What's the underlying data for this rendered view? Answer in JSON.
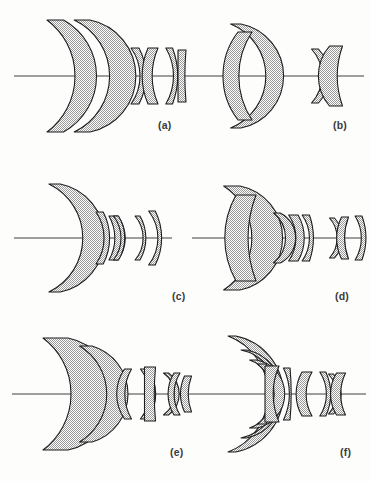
{
  "figure": {
    "kind": "optical-lens-cross-section-diagram",
    "background_color": "#fdfdfc",
    "outline_color": "#1d1d1d",
    "glass_fill_color": "#b4b4b4",
    "axis_color": "#2a2a2a",
    "label_color": "#3a3a3a",
    "panel_count": 6
  },
  "panels": [
    {
      "id": "a",
      "label": "(a)",
      "label_x": 158,
      "label_y": 119,
      "axis": {
        "x1": 14,
        "x2": 196,
        "y": 76
      },
      "element_count": 6,
      "groups": [
        {
          "name": "front-group",
          "element_count": 2
        },
        {
          "name": "rear-group",
          "element_count": 3
        }
      ],
      "elements": [
        {
          "index": 1,
          "type": "meniscus",
          "cx": 40,
          "cy": 76,
          "half_height": 56,
          "thickness": 14,
          "front_r": 70,
          "back_r": 64,
          "shift": 0
        },
        {
          "index": 2,
          "type": "meniscus",
          "cx": 65,
          "cy": 76,
          "half_height": 56,
          "thickness": 17,
          "front_r": 62,
          "back_r": 44,
          "shift": 0
        },
        {
          "index": 3,
          "type": "meniscus",
          "cx": 131,
          "cy": 76,
          "half_height": 28,
          "thickness": 9,
          "front_r": 48,
          "back_r": 60,
          "shift": 0
        },
        {
          "index": 4,
          "type": "biconvex",
          "cx": 153,
          "cy": 76,
          "half_height": 28,
          "thickness": 10,
          "front_r": 70,
          "back_r": 70,
          "shift": 0
        },
        {
          "index": 5,
          "type": "meniscus",
          "cx": 166,
          "cy": 76,
          "half_height": 28,
          "thickness": 8,
          "front_r": 55,
          "back_r": 80,
          "shift": 0
        },
        {
          "index": 6,
          "type": "plano-convex",
          "cx": 182,
          "cy": 76,
          "half_height": 26,
          "thickness": 8,
          "front_r": 90,
          "back_r": 300,
          "shift": 0
        }
      ]
    },
    {
      "id": "b",
      "label": "(b)",
      "label_x": 333,
      "label_y": 119,
      "axis": {
        "x1": 196,
        "x2": 364,
        "y": 76
      },
      "element_count": 4,
      "groups": [
        {
          "name": "front-group",
          "element_count": 2
        },
        {
          "name": "rear-group",
          "element_count": 2
        }
      ],
      "elements": [
        {
          "index": 1,
          "type": "meniscus",
          "cx": 218,
          "cy": 76,
          "half_height": 52,
          "thickness": 10,
          "front_r": 56,
          "back_r": 48,
          "shift": 0
        },
        {
          "index": 2,
          "type": "biconvex",
          "cx": 245,
          "cy": 76,
          "half_height": 44,
          "thickness": 14,
          "front_r": 72,
          "back_r": 80,
          "shift": 0
        },
        {
          "index": 3,
          "type": "biconcave",
          "cx": 315,
          "cy": 76,
          "half_height": 27,
          "thickness": 7,
          "front_r": 40,
          "back_r": 40,
          "shift": 0
        },
        {
          "index": 4,
          "type": "biconvex",
          "cx": 336,
          "cy": 76,
          "half_height": 30,
          "thickness": 13,
          "front_r": 46,
          "back_r": 90,
          "shift": 0
        }
      ]
    },
    {
      "id": "c",
      "label": "(c)",
      "label_x": 172,
      "label_y": 290,
      "axis": {
        "x1": 14,
        "x2": 172,
        "y": 238
      },
      "element_count": 6,
      "groups": [
        {
          "name": "front-group",
          "element_count": 1
        },
        {
          "name": "rear-group",
          "element_count": 5
        }
      ],
      "elements": [
        {
          "index": 1,
          "type": "meniscus",
          "cx": 36,
          "cy": 238,
          "half_height": 54,
          "thickness": 8,
          "front_r": 60,
          "back_r": 54,
          "shift": 0
        },
        {
          "index": 2,
          "type": "meniscus",
          "cx": 96,
          "cy": 238,
          "half_height": 26,
          "thickness": 8,
          "front_r": 46,
          "back_r": 56,
          "shift": 0
        },
        {
          "index": 3,
          "type": "meniscus",
          "cx": 110,
          "cy": 238,
          "half_height": 22,
          "thickness": 8,
          "front_r": 44,
          "back_r": 36,
          "shift": 0
        },
        {
          "index": 4,
          "type": "biconcave",
          "cx": 116,
          "cy": 238,
          "half_height": 22,
          "thickness": 5,
          "front_r": 36,
          "back_r": 42,
          "shift": 0
        },
        {
          "index": 5,
          "type": "meniscus",
          "cx": 134,
          "cy": 238,
          "half_height": 22,
          "thickness": 6,
          "front_r": 34,
          "back_r": 44,
          "shift": 0
        },
        {
          "index": 6,
          "type": "meniscus",
          "cx": 148,
          "cy": 238,
          "half_height": 27,
          "thickness": 8,
          "front_r": 44,
          "back_r": 60,
          "shift": 0
        }
      ]
    },
    {
      "id": "d",
      "label": "(d)",
      "label_x": 335,
      "label_y": 290,
      "axis": {
        "x1": 192,
        "x2": 366,
        "y": 238
      },
      "element_count": 8,
      "groups": [
        {
          "name": "front-group",
          "element_count": 4
        },
        {
          "name": "rear-group",
          "element_count": 4
        }
      ],
      "elements": [
        {
          "index": 1,
          "type": "meniscus",
          "cx": 215,
          "cy": 238,
          "half_height": 52,
          "thickness": 11,
          "front_r": 62,
          "back_r": 52,
          "shift": 0
        },
        {
          "index": 2,
          "type": "biconvex",
          "cx": 246,
          "cy": 238,
          "half_height": 43,
          "thickness": 20,
          "front_r": 88,
          "back_r": 120,
          "shift": 0
        },
        {
          "index": 3,
          "type": "meniscus",
          "cx": 270,
          "cy": 238,
          "half_height": 25,
          "thickness": 5,
          "front_r": 32,
          "back_r": 28,
          "shift": 0
        },
        {
          "index": 4,
          "type": "meniscus",
          "cx": 290,
          "cy": 238,
          "half_height": 23,
          "thickness": 10,
          "front_r": 40,
          "back_r": 46,
          "shift": 0
        },
        {
          "index": 5,
          "type": "meniscus",
          "cx": 303,
          "cy": 238,
          "half_height": 23,
          "thickness": 9,
          "front_r": 40,
          "back_r": 70,
          "shift": 0
        },
        {
          "index": 6,
          "type": "biconcave",
          "cx": 332,
          "cy": 238,
          "half_height": 20,
          "thickness": 5,
          "front_r": 30,
          "back_r": 30,
          "shift": 0
        },
        {
          "index": 7,
          "type": "biconvex",
          "cx": 345,
          "cy": 238,
          "half_height": 21,
          "thickness": 7,
          "front_r": 48,
          "back_r": 60,
          "shift": 0
        },
        {
          "index": 8,
          "type": "meniscus",
          "cx": 356,
          "cy": 238,
          "half_height": 22,
          "thickness": 8,
          "front_r": 42,
          "back_r": 64,
          "shift": 0
        }
      ]
    },
    {
      "id": "e",
      "label": "(e)",
      "label_x": 170,
      "label_y": 446,
      "axis": {
        "x1": 12,
        "x2": 192,
        "y": 394
      },
      "element_count": 8,
      "groups": [
        {
          "name": "front-group",
          "element_count": 2
        },
        {
          "name": "rear-group",
          "element_count": 6
        }
      ],
      "elements": [
        {
          "index": 1,
          "type": "meniscus",
          "cx": 38,
          "cy": 394,
          "half_height": 56,
          "thickness": 18,
          "front_r": 70,
          "back_r": 56,
          "shift": 0
        },
        {
          "index": 2,
          "type": "meniscus",
          "cx": 70,
          "cy": 394,
          "half_height": 48,
          "thickness": 8,
          "front_r": 56,
          "back_r": 50,
          "shift": 0
        },
        {
          "index": 3,
          "type": "biconvex",
          "cx": 128,
          "cy": 394,
          "half_height": 25,
          "thickness": 7,
          "front_r": 44,
          "back_r": 50,
          "shift": 0
        },
        {
          "index": 4,
          "type": "meniscus",
          "cx": 140,
          "cy": 394,
          "half_height": 25,
          "thickness": 8,
          "front_r": 40,
          "back_r": 44,
          "shift": 0
        },
        {
          "index": 5,
          "type": "plano-convex",
          "cx": 150,
          "cy": 394,
          "half_height": 27,
          "thickness": 11,
          "front_r": 44,
          "back_r": 300,
          "shift": 0
        },
        {
          "index": 6,
          "type": "biconcave",
          "cx": 166,
          "cy": 394,
          "half_height": 21,
          "thickness": 5,
          "front_r": 26,
          "back_r": 26,
          "shift": 0
        },
        {
          "index": 7,
          "type": "biconvex",
          "cx": 177,
          "cy": 394,
          "half_height": 21,
          "thickness": 6,
          "front_r": 40,
          "back_r": 40,
          "shift": 0
        },
        {
          "index": 8,
          "type": "biconvex",
          "cx": 188,
          "cy": 394,
          "half_height": 18,
          "thickness": 7,
          "front_r": 44,
          "back_r": 52,
          "shift": 0
        }
      ]
    },
    {
      "id": "f",
      "label": "(f)",
      "label_x": 340,
      "label_y": 446,
      "axis": {
        "x1": 192,
        "x2": 366,
        "y": 394
      },
      "element_count": 10,
      "groups": [
        {
          "name": "front-group",
          "element_count": 4
        },
        {
          "name": "middle-group",
          "element_count": 2
        },
        {
          "name": "rear-group",
          "element_count": 4
        }
      ],
      "elements": [
        {
          "index": 1,
          "type": "meniscus",
          "cx": 211,
          "cy": 394,
          "half_height": 58,
          "thickness": 6,
          "front_r": 62,
          "back_r": 58,
          "shift": 0
        },
        {
          "index": 2,
          "type": "meniscus",
          "cx": 228,
          "cy": 394,
          "half_height": 44,
          "thickness": 7,
          "front_r": 44,
          "back_r": 40,
          "shift": 0
        },
        {
          "index": 3,
          "type": "meniscus",
          "cx": 241,
          "cy": 394,
          "half_height": 34,
          "thickness": 7,
          "front_r": 36,
          "back_r": 33,
          "shift": 0
        },
        {
          "index": 4,
          "type": "meniscus",
          "cx": 256,
          "cy": 394,
          "half_height": 30,
          "thickness": 12,
          "front_r": 38,
          "back_r": 60,
          "shift": 0
        },
        {
          "index": 5,
          "type": "plano-convex",
          "cx": 272,
          "cy": 394,
          "half_height": 28,
          "thickness": 14,
          "front_r": 300,
          "back_r": 70,
          "shift": 0
        },
        {
          "index": 6,
          "type": "meniscus",
          "cx": 285,
          "cy": 394,
          "half_height": 26,
          "thickness": 9,
          "front_r": 60,
          "back_r": 300,
          "shift": 0
        },
        {
          "index": 7,
          "type": "biconvex",
          "cx": 307,
          "cy": 394,
          "half_height": 22,
          "thickness": 10,
          "front_r": 44,
          "back_r": 44,
          "shift": 0
        },
        {
          "index": 8,
          "type": "meniscus",
          "cx": 320,
          "cy": 394,
          "half_height": 22,
          "thickness": 7,
          "front_r": 40,
          "back_r": 54,
          "shift": 0
        },
        {
          "index": 9,
          "type": "biconcave",
          "cx": 331,
          "cy": 394,
          "half_height": 20,
          "thickness": 5,
          "front_r": 30,
          "back_r": 30,
          "shift": 0
        },
        {
          "index": 10,
          "type": "biconvex",
          "cx": 341,
          "cy": 394,
          "half_height": 21,
          "thickness": 9,
          "front_r": 40,
          "back_r": 48,
          "shift": 0
        }
      ]
    }
  ]
}
